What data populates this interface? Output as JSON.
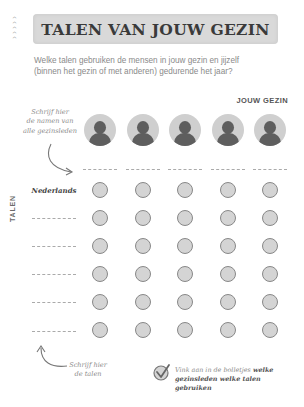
{
  "header": {
    "chevrons": [
      "^",
      "^",
      "^",
      "^",
      "^"
    ],
    "title": "TALEN VAN JOUW GEZIN",
    "intro_line1": "Welke talen gebruiken de mensen in jouw gezin en jijzelf",
    "intro_line2": "(binnen het gezin of met anderen) gedurende het jaar?"
  },
  "family": {
    "header": "JOUW GEZIN",
    "hint_line1": "Schrijf hier",
    "hint_line2": "de namen van",
    "hint_line3": "alle gezinsleden",
    "members": [
      {
        "icon": "person-avatar-icon",
        "name": ""
      },
      {
        "icon": "person-avatar-icon",
        "name": ""
      },
      {
        "icon": "person-avatar-icon",
        "name": ""
      },
      {
        "icon": "person-avatar-icon",
        "name": ""
      },
      {
        "icon": "person-avatar-icon",
        "name": ""
      }
    ]
  },
  "languages": {
    "axis_label": "TALEN",
    "rows": [
      {
        "label": "Nederlands"
      },
      {
        "label": ""
      },
      {
        "label": ""
      },
      {
        "label": ""
      },
      {
        "label": ""
      },
      {
        "label": ""
      }
    ],
    "hint_line1": "Schrijf hier",
    "hint_line2": "de talen"
  },
  "instruction": {
    "icon": "checkmark-circle-icon",
    "text_part1": "Vink aan in de bolletjes ",
    "text_bold1": "welke",
    "text_bold2": "gezinsleden welke talen gebruiken"
  },
  "colors": {
    "banner": "#d9d9d9",
    "avatar_bg": "#cfcfcf",
    "avatar_figure": "#5e5e5e",
    "dot_fill": "#d4d4d4",
    "dot_border": "#888888"
  }
}
